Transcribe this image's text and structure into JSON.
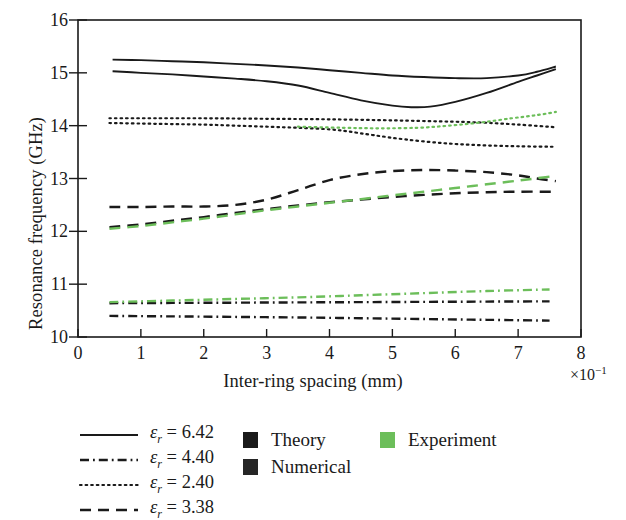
{
  "chart_data": {
    "type": "line",
    "title": "",
    "xlabel": "Inter-ring spacing (mm)",
    "ylabel": "Resonance frequency (GHz)",
    "x_multiplier": "×10⁻¹",
    "xlim": [
      0,
      8
    ],
    "ylim": [
      10,
      16
    ],
    "xticks": [
      "0",
      "1",
      "2",
      "3",
      "4",
      "5",
      "6",
      "7",
      "8"
    ],
    "yticks": [
      "10",
      "11",
      "12",
      "13",
      "14",
      "15",
      "16"
    ],
    "grid": false,
    "legend_position": "below-left",
    "series": [
      {
        "name": "εr = 6.42 Theory",
        "style": "solid",
        "color": "#1a1a1a",
        "x": [
          0.55,
          1.0,
          1.5,
          2.0,
          2.5,
          3.0,
          3.5,
          4.0,
          4.5,
          5.0,
          5.5,
          6.0,
          6.5,
          7.0,
          7.3,
          7.6
        ],
        "y": [
          15.25,
          15.24,
          15.22,
          15.2,
          15.17,
          15.14,
          15.1,
          15.05,
          15.0,
          14.95,
          14.92,
          14.9,
          14.9,
          14.95,
          15.02,
          15.12
        ]
      },
      {
        "name": "εr = 6.42 Numerical",
        "style": "solid",
        "color": "#1a1a1a",
        "x": [
          0.55,
          1.0,
          1.5,
          2.0,
          2.5,
          3.0,
          3.5,
          4.0,
          4.5,
          5.0,
          5.3,
          5.6,
          6.0,
          6.5,
          7.0,
          7.3,
          7.6
        ],
        "y": [
          15.03,
          15.0,
          14.97,
          14.93,
          14.89,
          14.84,
          14.76,
          14.62,
          14.48,
          14.38,
          14.35,
          14.36,
          14.45,
          14.62,
          14.83,
          14.95,
          15.07
        ]
      },
      {
        "name": "εr = 2.40 Theory",
        "style": "dotted",
        "color": "#1a1a1a",
        "x": [
          0.5,
          1.0,
          2.0,
          3.0,
          4.0,
          5.0,
          5.8,
          6.4,
          7.0,
          7.6
        ],
        "y": [
          14.14,
          14.14,
          14.14,
          14.13,
          14.12,
          14.1,
          14.08,
          14.06,
          14.02,
          13.97
        ]
      },
      {
        "name": "εr = 2.40 Numerical",
        "style": "dotted",
        "color": "#1a1a1a",
        "x": [
          0.5,
          1.0,
          1.5,
          2.0,
          2.5,
          3.0,
          3.5,
          4.0,
          4.3,
          4.7,
          5.2,
          5.8,
          6.4,
          7.0,
          7.6
        ],
        "y": [
          14.05,
          14.04,
          14.03,
          14.02,
          14.0,
          13.98,
          13.96,
          13.93,
          13.89,
          13.82,
          13.74,
          13.67,
          13.63,
          13.61,
          13.6
        ]
      },
      {
        "name": "εr = 2.40 Experiment",
        "style": "dotted",
        "color": "#6cbe5a",
        "x": [
          3.5,
          4.2,
          4.8,
          5.4,
          5.9,
          6.4,
          6.9,
          7.3,
          7.6
        ],
        "y": [
          13.98,
          13.96,
          13.95,
          13.96,
          14.0,
          14.06,
          14.14,
          14.2,
          14.26
        ]
      },
      {
        "name": "εr = 3.38 Theory",
        "style": "dashed",
        "color": "#1a1a1a",
        "x": [
          0.5,
          1.0,
          1.5,
          2.0,
          2.5,
          3.0,
          3.5,
          4.0,
          4.5,
          5.0,
          5.5,
          6.0,
          6.5,
          7.0,
          7.3,
          7.6
        ],
        "y": [
          12.46,
          12.46,
          12.47,
          12.47,
          12.5,
          12.6,
          12.78,
          12.97,
          13.08,
          13.14,
          13.16,
          13.15,
          13.12,
          13.06,
          13.0,
          12.95
        ]
      },
      {
        "name": "εr = 3.38 Numerical",
        "style": "dashed",
        "color": "#1a1a1a",
        "x": [
          0.5,
          1.0,
          1.5,
          2.0,
          2.5,
          3.0,
          3.5,
          4.0,
          4.5,
          5.0,
          5.5,
          6.0,
          6.5,
          7.0,
          7.6
        ],
        "y": [
          12.08,
          12.13,
          12.2,
          12.27,
          12.35,
          12.42,
          12.49,
          12.55,
          12.6,
          12.65,
          12.69,
          12.72,
          12.74,
          12.75,
          12.75
        ]
      },
      {
        "name": "εr = 3.38 Experiment",
        "style": "dashed",
        "color": "#6cbe5a",
        "x": [
          0.5,
          1.0,
          1.5,
          2.0,
          2.5,
          3.0,
          3.5,
          4.0,
          4.5,
          5.0,
          5.5,
          6.0,
          6.5,
          7.0,
          7.4,
          7.6
        ],
        "y": [
          12.05,
          12.1,
          12.17,
          12.24,
          12.32,
          12.4,
          12.47,
          12.54,
          12.61,
          12.68,
          12.75,
          12.82,
          12.89,
          12.96,
          13.02,
          13.05
        ]
      },
      {
        "name": "εr = 4.40 Theory",
        "style": "dashdot",
        "color": "#1a1a1a",
        "x": [
          0.5,
          1.5,
          2.5,
          3.5,
          4.5,
          5.5,
          6.5,
          7.5
        ],
        "y": [
          10.64,
          10.645,
          10.65,
          10.655,
          10.66,
          10.665,
          10.67,
          10.675
        ]
      },
      {
        "name": "εr = 4.40 Numerical",
        "style": "dashdot",
        "color": "#1a1a1a",
        "x": [
          0.5,
          1.5,
          2.5,
          3.5,
          4.5,
          5.5,
          6.5,
          7.5
        ],
        "y": [
          10.4,
          10.39,
          10.38,
          10.37,
          10.355,
          10.34,
          10.325,
          10.31
        ]
      },
      {
        "name": "εr = 4.40 Experiment",
        "style": "dashdot",
        "color": "#6cbe5a",
        "x": [
          0.5,
          1.5,
          2.5,
          3.5,
          4.5,
          5.5,
          6.5,
          7.5
        ],
        "y": [
          10.66,
          10.69,
          10.72,
          10.75,
          10.79,
          10.83,
          10.87,
          10.9
        ]
      }
    ]
  },
  "axes": {
    "ylabel": "Resonance frequency (GHz)",
    "xlabel": "Inter-ring spacing (mm)",
    "x_multiplier_base": "×10",
    "x_multiplier_exp": "−1",
    "xticks": [
      "0",
      "1",
      "2",
      "3",
      "4",
      "5",
      "6",
      "7",
      "8"
    ],
    "yticks": [
      "16",
      "15",
      "14",
      "13",
      "12",
      "11",
      "10"
    ]
  },
  "legend": {
    "line_entries": [
      {
        "style": "solid",
        "eps": "ε",
        "sub": "r",
        "eq": " = 6.42",
        "label": "εr = 6.42"
      },
      {
        "style": "dashdot",
        "eps": "ε",
        "sub": "r",
        "eq": " = 4.40",
        "label": "εr = 4.40"
      },
      {
        "style": "dotted",
        "eps": "ε",
        "sub": "r",
        "eq": " = 2.40",
        "label": "εr = 2.40"
      },
      {
        "style": "dashed",
        "eps": "ε",
        "sub": "r",
        "eq": " = 3.38",
        "label": "εr = 3.38"
      }
    ],
    "swatch_entries": [
      {
        "label": "Theory",
        "color": "#1a1a1a"
      },
      {
        "label": "Numerical",
        "color": "#262626"
      },
      {
        "label": "Experiment",
        "color": "#6cbe5a"
      }
    ]
  },
  "colors": {
    "line": "#1a1a1a",
    "experiment": "#6cbe5a",
    "axis": "#1a1a1a",
    "background": "#ffffff"
  }
}
